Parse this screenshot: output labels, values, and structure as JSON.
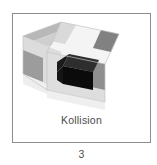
{
  "figure": {
    "caption_label": "Kollision",
    "number_label": "3",
    "frame": {
      "border_color": "#8d8d8d",
      "background_color": "#ffffff"
    },
    "illustration": {
      "name": "isometric-block-collision-diagram",
      "description": "Isometric rectangular block with light gray body, medium gray end-cap terminal bands and a black highlighted collision region on the front face",
      "colors": {
        "top_face": "#f2f2f2",
        "top_face_band": "#808080",
        "left_face": "#e8e8e8",
        "left_face_band": "#b5b5b5",
        "left_face_band_dark": "#9a9a9a",
        "right_face": "#d6d6d6",
        "right_face_band": "#8f8f8f",
        "collision_top": "#2b2b2b",
        "collision_front": "#0d0d0d",
        "collision_side": "#1a1a1a",
        "edge_line": "#c9c9c9"
      }
    }
  }
}
